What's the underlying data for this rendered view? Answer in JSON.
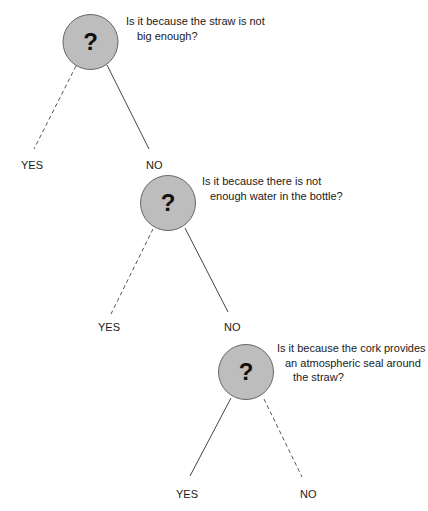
{
  "diagram": {
    "type": "decision-tree",
    "nodes": [
      {
        "id": "q1",
        "symbol": "?",
        "question_lines": [
          "Is it because the straw is not",
          "big enough?"
        ],
        "branches": {
          "left": {
            "label": "YES",
            "style": "dashed"
          },
          "right": {
            "label": "NO",
            "style": "solid"
          }
        }
      },
      {
        "id": "q2",
        "symbol": "?",
        "question_lines": [
          "Is it because there is not",
          "enough water in the bottle?"
        ],
        "branches": {
          "left": {
            "label": "YES",
            "style": "dashed"
          },
          "right": {
            "label": "NO",
            "style": "solid"
          }
        }
      },
      {
        "id": "q3",
        "symbol": "?",
        "question_lines": [
          "Is it because the cork provides",
          "an atmospheric seal around",
          "the straw?"
        ],
        "branches": {
          "left": {
            "label": "YES",
            "style": "solid"
          },
          "right": {
            "label": "NO",
            "style": "dashed"
          }
        }
      }
    ],
    "colors": {
      "node_fill": "#bdbdbd",
      "node_stroke": "#555555",
      "line": "#444444",
      "text": "#1a1a1a"
    }
  }
}
